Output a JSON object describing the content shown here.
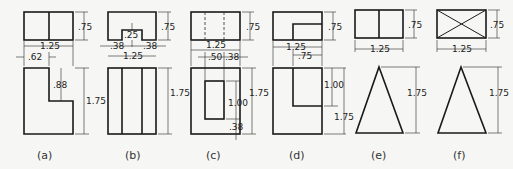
{
  "figure": {
    "views": [
      {
        "id": "a",
        "label": "(a)",
        "top_height": ".75",
        "width": "1.25",
        "offset": ".62",
        "notch_depth": ".88",
        "front_height": "1.75"
      },
      {
        "id": "b",
        "label": "(b)",
        "top_height": ".75",
        "slot_depth": ".25",
        "left": ".38",
        "right": ".38",
        "width": "1.25",
        "front_height": "1.75"
      },
      {
        "id": "c",
        "label": "(c)",
        "top_height": ".75",
        "width": "1.25",
        "hole_width": ".50",
        "hole_offset": ".38",
        "front_height": "1.75",
        "hole_height": "1.00",
        "bottom": ".38"
      },
      {
        "id": "d",
        "label": "(d)",
        "top_height": ".75",
        "width": "1.25",
        "step_width": ".75",
        "step_height": "1.00",
        "front_height": "1.75"
      },
      {
        "id": "e",
        "label": "(e)",
        "top_height": ".75",
        "width": "1.25",
        "front_height": "1.75"
      },
      {
        "id": "f",
        "label": "(f)",
        "top_height": ".75",
        "width": "1.25",
        "front_height": "1.75"
      }
    ]
  },
  "colors": {
    "line": "#1a1a1a",
    "background": "#f6f6f4"
  }
}
